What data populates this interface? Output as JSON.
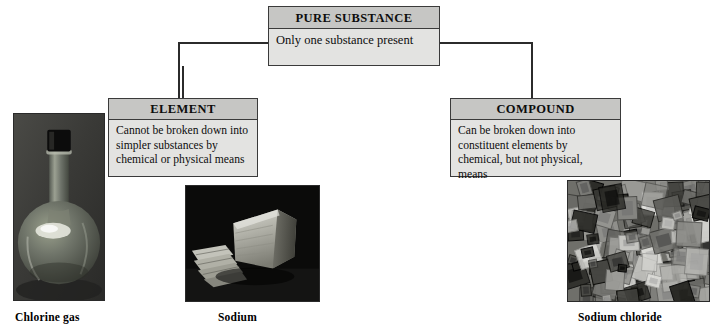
{
  "diagram": {
    "nodes": {
      "pure": {
        "header": "PURE SUBSTANCE",
        "body": "Only one substance present"
      },
      "element": {
        "header": "ELEMENT",
        "body": "Cannot be broken down into simpler substances by chemical or physical means"
      },
      "compound": {
        "header": "COMPOUND",
        "body": "Can be broken down into constituent elements by chemical, but not physical, means"
      }
    },
    "photos": [
      {
        "name": "chlorine-gas-flask",
        "caption": "Chlorine gas",
        "subject": "round-bottom flask of greenish chlorine gas with black stopper"
      },
      {
        "name": "sodium-metal",
        "caption": "Sodium",
        "subject": "chunks of freshly cut sodium metal on dark background"
      },
      {
        "name": "sodium-chloride-crystals",
        "caption": "Sodium chloride",
        "subject": "magnified cubic salt crystals"
      }
    ],
    "colors": {
      "header_fill": "#c6c6c4",
      "body_fill": "#e3e3e1",
      "border": "#3a3a3a",
      "connector": "#2b2b2b",
      "text": "#0d0d0d"
    }
  }
}
